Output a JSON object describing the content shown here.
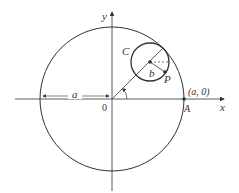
{
  "diagram": {
    "type": "geometry",
    "colors": {
      "stroke": "#333333",
      "background": "#ffffff"
    },
    "labels": {
      "x_axis": "x",
      "y_axis": "y",
      "origin": "0",
      "radius_a": "a",
      "angle": "θ",
      "point_A_coords": "(a, 0)",
      "point_A": "A",
      "small_circle": "C",
      "radius_b": "b",
      "point_P": "P"
    }
  }
}
